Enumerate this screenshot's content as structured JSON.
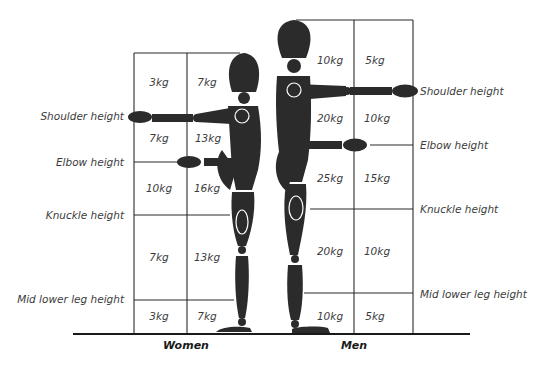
{
  "diagram": {
    "ground_color": "#1a1a1a",
    "figure_color": "#2b2b2b",
    "women": {
      "label": "Women",
      "height_labels": {
        "shoulder": "Shoulder height",
        "elbow": "Elbow height",
        "knuckle": "Knuckle height",
        "mid_lower_leg": "Mid lower leg height"
      },
      "zones": [
        {
          "zone": "above shoulder",
          "close": "3kg",
          "far": "7kg"
        },
        {
          "zone": "shoulder to elbow",
          "close": "7kg",
          "far": "13kg"
        },
        {
          "zone": "elbow to knuckle",
          "close": "10kg",
          "far": "16kg"
        },
        {
          "zone": "knuckle to mid lower leg",
          "close": "7kg",
          "far": "13kg"
        },
        {
          "zone": "below mid lower leg",
          "close": "3kg",
          "far": "7kg"
        }
      ]
    },
    "men": {
      "label": "Men",
      "height_labels": {
        "shoulder": "Shoulder height",
        "elbow": "Elbow height",
        "knuckle": "Knuckle height",
        "mid_lower_leg": "Mid lower leg height"
      },
      "zones": [
        {
          "zone": "above shoulder",
          "close": "10kg",
          "far": "5kg"
        },
        {
          "zone": "shoulder to elbow",
          "close": "20kg",
          "far": "10kg"
        },
        {
          "zone": "elbow to knuckle",
          "close": "25kg",
          "far": "15kg"
        },
        {
          "zone": "knuckle to mid lower leg",
          "close": "20kg",
          "far": "10kg"
        },
        {
          "zone": "below mid lower leg",
          "close": "10kg",
          "far": "5kg"
        }
      ]
    }
  }
}
